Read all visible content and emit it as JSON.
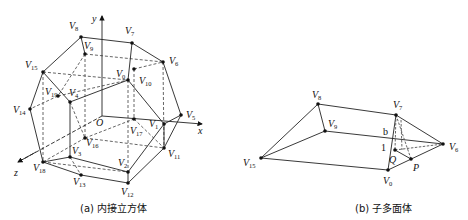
{
  "figure_a": {
    "caption": "(a) 内接立方体",
    "axes": {
      "x": "x",
      "y": "y",
      "z": "z",
      "origin": "O"
    },
    "vertices": {
      "V8": {
        "name": "V",
        "sub": "8",
        "x": 81,
        "y": 37,
        "lx": 69,
        "ly": 29
      },
      "V7": {
        "name": "V",
        "sub": "7",
        "x": 132,
        "y": 43,
        "lx": 125,
        "ly": 34
      },
      "V9": {
        "name": "V",
        "sub": "9",
        "x": 85,
        "y": 54,
        "lx": 84,
        "ly": 49
      },
      "V6": {
        "name": "V",
        "sub": "6",
        "x": 163,
        "y": 62,
        "lx": 169,
        "ly": 64
      },
      "V15": {
        "name": "V",
        "sub": "15",
        "x": 43,
        "y": 72,
        "lx": 25,
        "ly": 68
      },
      "V0": {
        "name": "V",
        "sub": "0",
        "x": 128,
        "y": 80,
        "lx": 116,
        "ly": 77
      },
      "V10": {
        "name": "V",
        "sub": "10",
        "x": 134,
        "y": 69,
        "lx": 139,
        "ly": 84
      },
      "V19": {
        "name": "V",
        "sub": "19",
        "x": 58,
        "y": 96,
        "lx": 45,
        "ly": 95
      },
      "V4": {
        "name": "V",
        "sub": "4",
        "x": 70,
        "y": 102,
        "lx": 69,
        "ly": 96
      },
      "V14": {
        "name": "V",
        "sub": "14",
        "x": 30,
        "y": 109,
        "lx": 13,
        "ly": 113
      },
      "V5": {
        "name": "V",
        "sub": "5",
        "x": 181,
        "y": 115,
        "lx": 186,
        "ly": 118
      },
      "V1": {
        "name": "V",
        "sub": "1",
        "x": 164,
        "y": 124,
        "lx": 149,
        "ly": 127
      },
      "V17": {
        "name": "V",
        "sub": "17",
        "x": 134,
        "y": 119,
        "lx": 130,
        "ly": 134
      },
      "V16": {
        "name": "V",
        "sub": "16",
        "x": 85,
        "y": 138,
        "lx": 86,
        "ly": 146
      },
      "V3": {
        "name": "V",
        "sub": "3",
        "x": 70,
        "y": 157,
        "lx": 72,
        "ly": 154
      },
      "V11": {
        "name": "V",
        "sub": "11",
        "x": 164,
        "y": 148,
        "lx": 168,
        "ly": 157
      },
      "V18": {
        "name": "V",
        "sub": "18",
        "x": 43,
        "y": 162,
        "lx": 33,
        "ly": 171
      },
      "V2": {
        "name": "V",
        "sub": "2",
        "x": 128,
        "y": 172,
        "lx": 118,
        "ly": 166
      },
      "V13": {
        "name": "V",
        "sub": "13",
        "x": 81,
        "y": 175,
        "lx": 73,
        "ly": 185
      },
      "V12": {
        "name": "V",
        "sub": "12",
        "x": 128,
        "y": 183,
        "lx": 121,
        "ly": 195
      }
    }
  },
  "figure_b": {
    "caption": "(b) 子多面体",
    "labels": {
      "b": "b",
      "one": "1",
      "Q": "Q",
      "P": "P"
    },
    "vertices": {
      "V8": {
        "name": "V",
        "sub": "8",
        "x": 318,
        "y": 104,
        "lx": 312,
        "ly": 98
      },
      "V7": {
        "name": "V",
        "sub": "7",
        "x": 396,
        "y": 115,
        "lx": 393,
        "ly": 108
      },
      "V9": {
        "name": "V",
        "sub": "9",
        "x": 325,
        "y": 131,
        "lx": 328,
        "ly": 127
      },
      "V6": {
        "name": "V",
        "sub": "6",
        "x": 443,
        "y": 144,
        "lx": 449,
        "ly": 150
      },
      "V15": {
        "name": "V",
        "sub": "15",
        "x": 261,
        "y": 158,
        "lx": 243,
        "ly": 166
      },
      "V0": {
        "name": "V",
        "sub": "0",
        "x": 388,
        "y": 170,
        "lx": 383,
        "ly": 184
      }
    }
  }
}
